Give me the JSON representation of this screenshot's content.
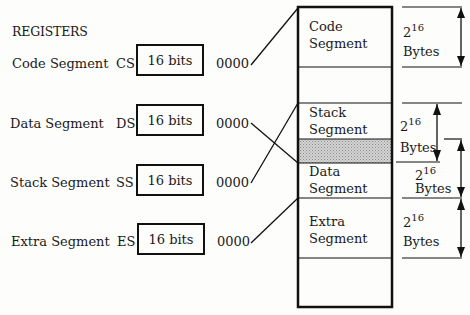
{
  "title": "REGISTERS",
  "registers": [
    {
      "name": "Code Segment",
      "abbr": "CS",
      "width": "16 bits",
      "offset": "0000"
    },
    {
      "name": "Data Segment",
      "abbr": "DS",
      "width": "16 bits",
      "offset": "0000"
    },
    {
      "name": "Stack Segment",
      "abbr": "SS",
      "width": "16 bits",
      "offset": "0000"
    },
    {
      "name": "Extra Segment",
      "abbr": "ES",
      "width": "16 bits",
      "offset": "0000"
    }
  ],
  "memory": {
    "segments": [
      {
        "line1": "Code",
        "line2": "Segment"
      },
      {
        "line1": "Stack",
        "line2": "Segment"
      },
      {
        "line1": "Data",
        "line2": "Segment"
      },
      {
        "line1": "Extra",
        "line2": "Segment"
      }
    ]
  },
  "sizes": [
    {
      "base": "2",
      "exp": "16",
      "unit": "Bytes"
    },
    {
      "base": "2",
      "exp": "16",
      "unit": "Bytes"
    },
    {
      "base": "2",
      "exp": "16",
      "unit": "Bytes"
    },
    {
      "base": "2",
      "exp": "16",
      "unit": "Bytes"
    }
  ]
}
